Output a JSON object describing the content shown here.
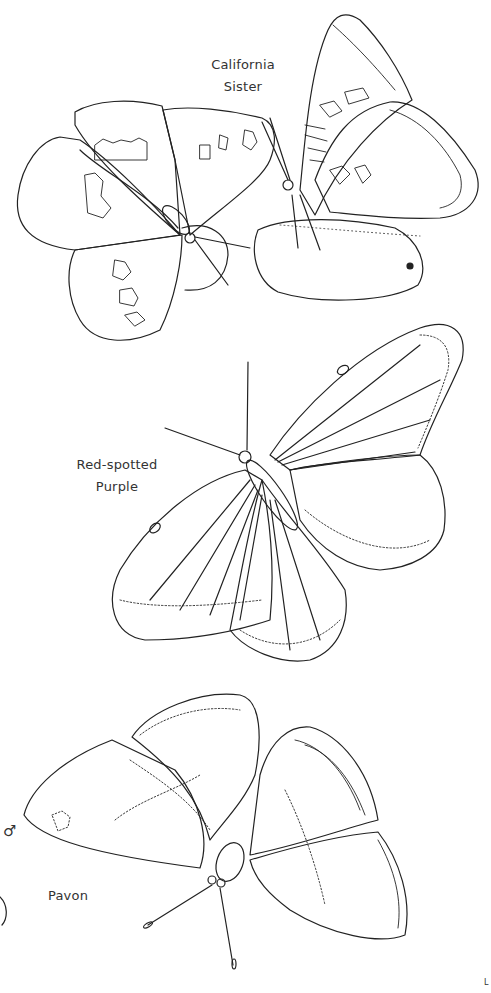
{
  "page": {
    "type": "coloring-book-page",
    "background": "#ffffff",
    "line_color": "#222222"
  },
  "labels": {
    "california_sister": [
      "California",
      "Sister"
    ],
    "red_spotted_purple": [
      "Red-spotted",
      "Purple"
    ],
    "pavon": "Pavon",
    "pavon_sex_symbol": "♂",
    "corner_mark": "L"
  },
  "illustrations": [
    {
      "name": "California Sister (open wings, dorsal)",
      "region": "top-left"
    },
    {
      "name": "California Sister (closed wings on rock)",
      "region": "top-right"
    },
    {
      "name": "Red-spotted Purple",
      "region": "middle"
    },
    {
      "name": "Pavon male",
      "region": "bottom"
    }
  ]
}
